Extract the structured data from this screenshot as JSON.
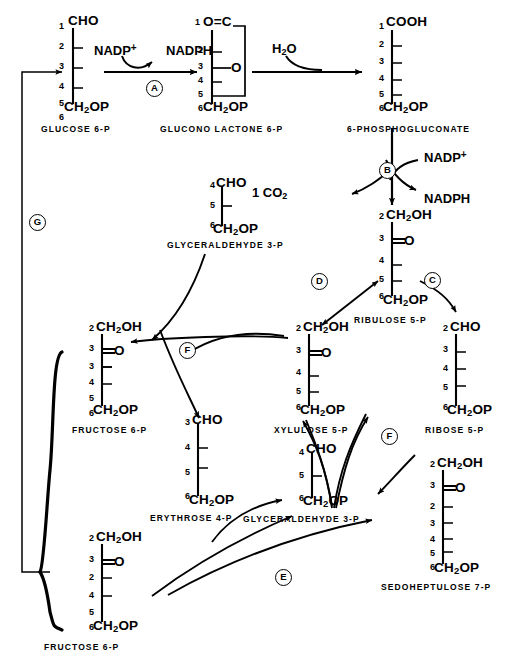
{
  "diagram": {
    "ink_color": "#000000",
    "background_color": "#ffffff"
  },
  "molecules": [
    {
      "id": "glucose6p",
      "name": "GLUCOSE 6-P",
      "top_group": "CHO",
      "bottom_group": "CH2OP",
      "carbon_labels": [
        "1",
        "2",
        "3",
        "4",
        "5",
        "6"
      ],
      "x": 52,
      "y": 14
    },
    {
      "id": "gluconolactone6p",
      "name": "GLUCONO LACTONE 6-P",
      "top_group": "O=C",
      "bottom_group": "CH2OP",
      "ring_oxygen": "O",
      "carbon_labels": [
        "1",
        "2",
        "3",
        "4",
        "5",
        "6"
      ],
      "x": 188,
      "y": 14
    },
    {
      "id": "phosphogluconate",
      "name": "6-PHOSPHOGLUCONATE",
      "top_group": "COOH",
      "bottom_group": "CH2OP",
      "carbon_labels": [
        "1",
        "2",
        "3",
        "4",
        "5",
        "6"
      ],
      "x": 372,
      "y": 14
    },
    {
      "id": "ribulose5p",
      "name": "RIBULOSE 5-P",
      "top_group": "CH2OH",
      "keto_group": "O",
      "bottom_group": "CH2OP",
      "carbon_labels": [
        "2",
        "3",
        "4",
        "5",
        "6"
      ],
      "x": 372,
      "y": 206
    },
    {
      "id": "glyceraldehyde3p_top",
      "name": "GLYCERALDEHYDE 3-P",
      "top_group": "CHO",
      "bottom_group": "CH2OP",
      "carbon_labels": [
        "4",
        "5",
        "6"
      ],
      "x": 203,
      "y": 175
    },
    {
      "id": "xylulose5p",
      "name": "XYLULOSE 5-P",
      "top_group": "CH2OH",
      "keto_group": "O",
      "bottom_group": "CH2OP",
      "carbon_labels": [
        "2",
        "3",
        "4",
        "5",
        "6"
      ],
      "x": 289,
      "y": 318
    },
    {
      "id": "ribose5p",
      "name": "RIBOSE 5-P",
      "top_group": "CHO",
      "bottom_group": "CH2OP",
      "carbon_labels": [
        "2",
        "3",
        "4",
        "5",
        "6"
      ],
      "x": 436,
      "y": 318
    },
    {
      "id": "fructose6p_upper",
      "name": "FRUCTOSE 6-P",
      "top_group": "CH2OH",
      "keto_group": "O",
      "bottom_group": "CH2OP",
      "carbon_labels": [
        "2",
        "3",
        "3",
        "4",
        "5",
        "6"
      ],
      "x": 82,
      "y": 318
    },
    {
      "id": "erythrose4p",
      "name": "ERYTHROSE 4-P",
      "top_group": "CHO",
      "bottom_group": "CH2OP",
      "carbon_labels": [
        "3",
        "4",
        "5",
        "6"
      ],
      "x": 178,
      "y": 412
    },
    {
      "id": "glyceraldehyde3p_mid",
      "name": "GLYCERALDEHYDE 3-P",
      "top_group": "CHO",
      "bottom_group": "CH2OP",
      "carbon_labels": [
        "4",
        "5",
        "6"
      ],
      "x": 292,
      "y": 441
    },
    {
      "id": "sedoheptulose7p",
      "name": "SEDOHEPTULOSE 7-P",
      "top_group": "CH2OH",
      "keto_group": "O",
      "bottom_group": "CH2OP",
      "carbon_labels": [
        "2",
        "3",
        "2",
        "3",
        "4",
        "5",
        "6"
      ],
      "x": 423,
      "y": 455
    },
    {
      "id": "fructose6p_lower",
      "name": "FRUCTOSE 6-P",
      "top_group": "CH2OH",
      "keto_group": "O",
      "bottom_group": "CH2OP",
      "carbon_labels": [
        "2",
        "3",
        "2",
        "4",
        "5",
        "6"
      ],
      "x": 82,
      "y": 528
    }
  ],
  "cofactors": [
    {
      "id": "nadp_plus_a",
      "text": "NADP+",
      "x": 94,
      "y": 44
    },
    {
      "id": "nadph_a",
      "text": "NADPH",
      "x": 166,
      "y": 44
    },
    {
      "id": "water",
      "text": "H2O",
      "x": 272,
      "y": 42
    },
    {
      "id": "nadp_plus_b",
      "text": "NADP+",
      "x": 424,
      "y": 151
    },
    {
      "id": "nadph_b",
      "text": "NADPH",
      "x": 424,
      "y": 192
    },
    {
      "id": "co2",
      "text": "1 CO2",
      "x": 252,
      "y": 186
    }
  ],
  "enzymes": [
    {
      "id": "enzyme-a",
      "label": "A",
      "x": 146,
      "y": 80,
      "meaning": "glucose-6-phosphate dehydrogenase"
    },
    {
      "id": "enzyme-b",
      "label": "B",
      "x": 379,
      "y": 162,
      "meaning": "6-phosphogluconate dehydrogenase"
    },
    {
      "id": "enzyme-c",
      "label": "C",
      "x": 424,
      "y": 272,
      "meaning": "ribose-5-phosphate isomerase"
    },
    {
      "id": "enzyme-d",
      "label": "D",
      "x": 311,
      "y": 273,
      "meaning": "ribulose-5-phosphate epimerase"
    },
    {
      "id": "enzyme-e",
      "label": "E",
      "x": 275,
      "y": 569,
      "meaning": "transaldolase"
    },
    {
      "id": "enzyme-f1",
      "label": "F",
      "x": 179,
      "y": 342,
      "meaning": "transketolase"
    },
    {
      "id": "enzyme-f2",
      "label": "F",
      "x": 381,
      "y": 428,
      "meaning": "transketolase"
    },
    {
      "id": "enzyme-g",
      "label": "G",
      "x": 29,
      "y": 214,
      "meaning": "hexose phosphate recycling"
    }
  ]
}
